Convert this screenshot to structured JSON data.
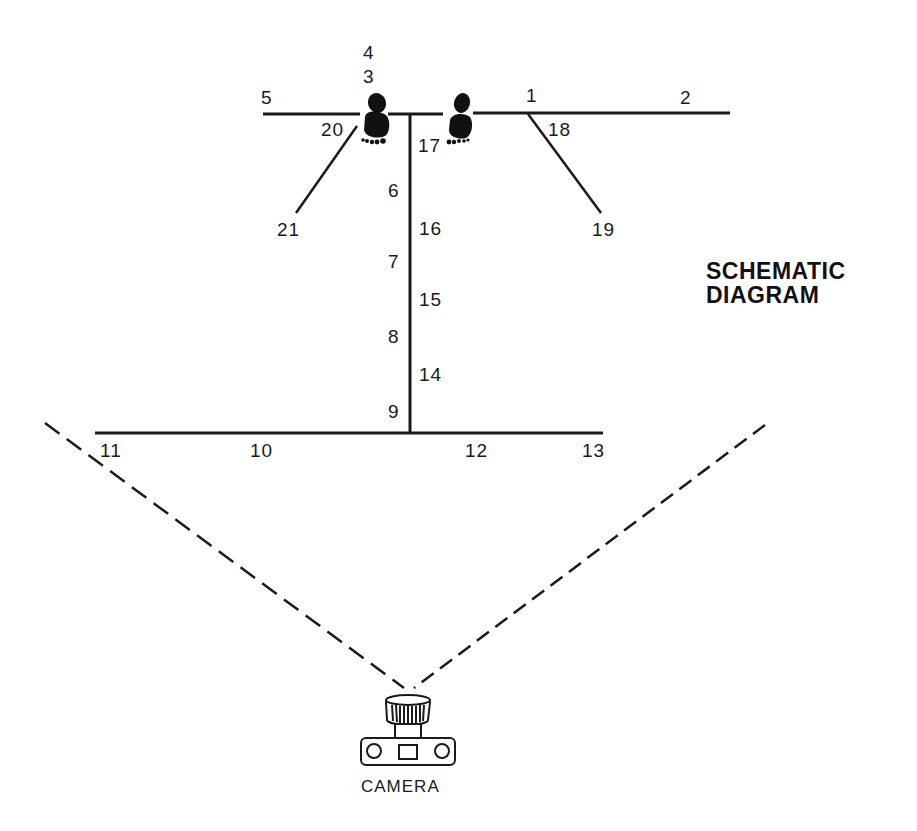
{
  "diagram": {
    "title_line1": "SCHEMATIC",
    "title_line2": "DIAGRAM",
    "camera_label": "CAMERA",
    "line_color": "#1a1a1a",
    "background": "#ffffff",
    "points": [
      {
        "id": "1",
        "label": "1"
      },
      {
        "id": "2",
        "label": "2"
      },
      {
        "id": "3",
        "label": "3"
      },
      {
        "id": "4",
        "label": "4"
      },
      {
        "id": "5",
        "label": "5"
      },
      {
        "id": "6",
        "label": "6"
      },
      {
        "id": "7",
        "label": "7"
      },
      {
        "id": "8",
        "label": "8"
      },
      {
        "id": "9",
        "label": "9"
      },
      {
        "id": "10",
        "label": "10"
      },
      {
        "id": "11",
        "label": "11"
      },
      {
        "id": "12",
        "label": "12"
      },
      {
        "id": "13",
        "label": "13"
      },
      {
        "id": "14",
        "label": "14"
      },
      {
        "id": "15",
        "label": "15"
      },
      {
        "id": "16",
        "label": "16"
      },
      {
        "id": "17",
        "label": "17"
      },
      {
        "id": "18",
        "label": "18"
      },
      {
        "id": "19",
        "label": "19"
      },
      {
        "id": "20",
        "label": "20"
      },
      {
        "id": "21",
        "label": "21"
      }
    ],
    "elements": {
      "top_line": "horizontal line with two footprints (start position)",
      "center_line": "vertical line connecting top and bottom lines",
      "bottom_line": "horizontal line",
      "diagonals": [
        "left diagonal 20-21",
        "right diagonal 18-19"
      ],
      "field_of_view": "two dashed lines diverging from camera",
      "icons": [
        "left-footprint",
        "right-footprint",
        "camera"
      ]
    }
  }
}
